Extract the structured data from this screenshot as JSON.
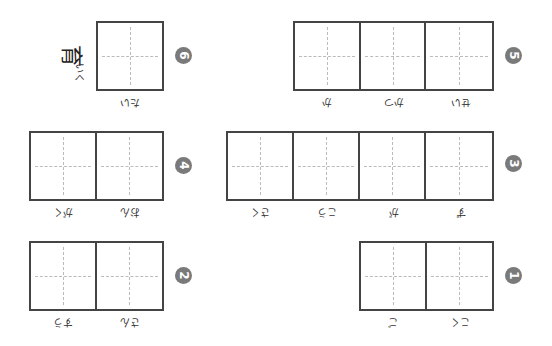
{
  "items": [
    {
      "number": "1",
      "cells": 2,
      "furigana": [
        "こく",
        "ご"
      ]
    },
    {
      "number": "2",
      "cells": 2,
      "furigana": [
        "さん",
        "すう"
      ]
    },
    {
      "number": "3",
      "cells": 4,
      "furigana": [
        "ず",
        "が",
        "こう",
        "さく"
      ]
    },
    {
      "number": "4",
      "cells": 2,
      "furigana": [
        "おん",
        "がく"
      ]
    },
    {
      "number": "5",
      "cells": 3,
      "furigana": [
        "せい",
        "かつ",
        "か"
      ]
    },
    {
      "number": "6",
      "cells": 1,
      "furigana": [
        "たい"
      ],
      "given_kanji": "育",
      "given_okurigana": "いく"
    }
  ],
  "colors": {
    "number_badge": "#7a7a7a",
    "grid_border": "#444444",
    "guide_line": "#bbbbbb"
  }
}
